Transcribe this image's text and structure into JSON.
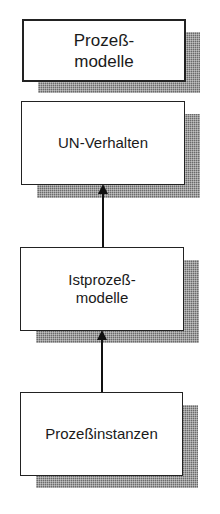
{
  "diagram": {
    "title_box": {
      "label": "Prozeß-\nmodelle"
    },
    "nodes": [
      {
        "id": "un-verhalten",
        "label": "UN-Verhalten"
      },
      {
        "id": "istprozessmodelle",
        "label": "Istprozeß-\nmodelle"
      },
      {
        "id": "prozessinstanzen",
        "label": "Prozeßinstanzen"
      }
    ],
    "edges": [
      {
        "from": "istprozessmodelle",
        "to": "un-verhalten",
        "style": "arrow-up"
      },
      {
        "from": "prozessinstanzen",
        "to": "istprozessmodelle",
        "style": "arrow-up"
      }
    ],
    "colors": {
      "border": "#222222",
      "shadow": "#6a6a6a",
      "background": "#ffffff"
    }
  }
}
